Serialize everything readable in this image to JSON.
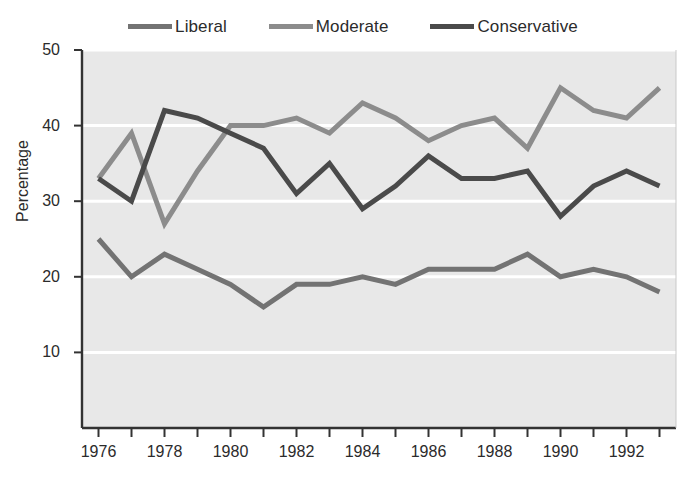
{
  "legend": {
    "position": "top-center",
    "items": [
      {
        "label": "Liberal",
        "color": "#737373",
        "icon": "line-swatch-icon"
      },
      {
        "label": "Moderate",
        "color": "#8c8c8c",
        "icon": "line-swatch-icon"
      },
      {
        "label": "Conservative",
        "color": "#4a4a4a",
        "icon": "line-swatch-icon"
      }
    ]
  },
  "axes": {
    "ylabel": "Percentage",
    "xlabel": "",
    "yticks": [
      10,
      20,
      30,
      40,
      50
    ],
    "ytick_labels": [
      "10",
      "20",
      "30",
      "40",
      "50"
    ],
    "xticks": [
      1976,
      1977,
      1978,
      1979,
      1980,
      1981,
      1982,
      1983,
      1984,
      1985,
      1986,
      1987,
      1988,
      1989,
      1990,
      1991,
      1992,
      1993
    ],
    "xtick_labels_shown": [
      "1976",
      "1978",
      "1980",
      "1982",
      "1984",
      "1986",
      "1988",
      "1990",
      "1992"
    ]
  },
  "style": {
    "plot_background": "#e8e8e8",
    "gridline_color": "#ffffff",
    "axis_color": "#333333",
    "page_background": "#ffffff"
  },
  "chart_data": {
    "type": "line",
    "title": "",
    "subtitle": "",
    "xlabel": "",
    "ylabel": "Percentage",
    "x": [
      1976,
      1977,
      1978,
      1979,
      1980,
      1981,
      1982,
      1983,
      1984,
      1985,
      1986,
      1987,
      1988,
      1989,
      1990,
      1991,
      1992,
      1993
    ],
    "xlim": [
      1975.5,
      1993.5
    ],
    "ylim": [
      0,
      50
    ],
    "grid": true,
    "legend_position": "top-center",
    "series": [
      {
        "name": "Liberal",
        "color": "#737373",
        "values": [
          25,
          20,
          23,
          21,
          19,
          16,
          19,
          19,
          20,
          19,
          21,
          21,
          21,
          23,
          20,
          21,
          20,
          18
        ]
      },
      {
        "name": "Moderate",
        "color": "#8c8c8c",
        "values": [
          33,
          39,
          27,
          34,
          40,
          40,
          41,
          39,
          43,
          41,
          38,
          40,
          41,
          37,
          45,
          42,
          41,
          45
        ]
      },
      {
        "name": "Conservative",
        "color": "#4a4a4a",
        "values": [
          33,
          30,
          42,
          41,
          39,
          37,
          31,
          35,
          29,
          32,
          36,
          33,
          33,
          34,
          28,
          32,
          34,
          32
        ]
      }
    ]
  }
}
